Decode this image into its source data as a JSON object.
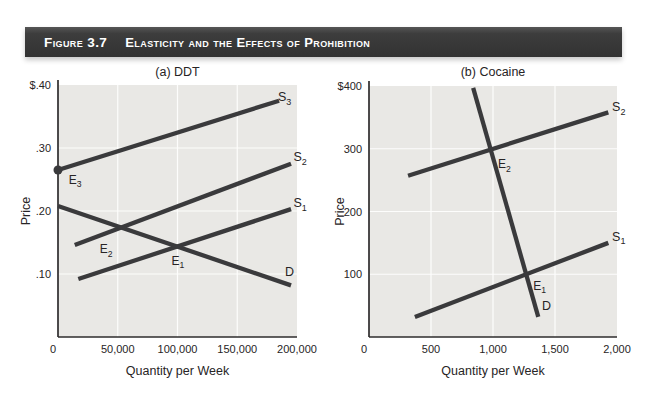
{
  "header": {
    "figure_label": "Figure 3.7",
    "figure_title": "Elasticity and the Effects of Prohibition"
  },
  "colors": {
    "header_bar": "#3d3d3d",
    "header_text": "#ffffff",
    "plot_bg": "#e9e8e5",
    "grid": "#fdfdfc",
    "axis": "#2e2c2d",
    "curve": "#3a3a3c",
    "text": "#272425"
  },
  "chart_data": [
    {
      "type": "line",
      "title": "(a) DDT",
      "xlabel": "Quantity per Week",
      "ylabel": "Price",
      "xlim": [
        0,
        200000
      ],
      "ylim": [
        0,
        0.4
      ],
      "grid": true,
      "xticks": [
        {
          "v": 0,
          "label": "0"
        },
        {
          "v": 50000,
          "label": "50,000"
        },
        {
          "v": 100000,
          "label": "100,000"
        },
        {
          "v": 150000,
          "label": "150,000"
        },
        {
          "v": 200000,
          "label": "200,000"
        }
      ],
      "yticks": [
        {
          "v": 0.4,
          "label": "$.40"
        },
        {
          "v": 0.3,
          "label": ".30"
        },
        {
          "v": 0.2,
          "label": ".20"
        },
        {
          "v": 0.1,
          "label": ".10"
        }
      ],
      "series": [
        {
          "name": "S3",
          "role": "supply",
          "label": "S",
          "sub": "3",
          "points": [
            [
              0,
              0.265
            ],
            [
              185000,
              0.375
            ]
          ],
          "label_at": [
            184000,
            0.374
          ]
        },
        {
          "name": "S2",
          "role": "supply",
          "label": "S",
          "sub": "2",
          "points": [
            [
              14000,
              0.146
            ],
            [
              195000,
              0.275
            ]
          ],
          "label_at": [
            197000,
            0.279
          ]
        },
        {
          "name": "S1",
          "role": "supply",
          "label": "S",
          "sub": "1",
          "points": [
            [
              17000,
              0.092
            ],
            [
              195000,
              0.203
            ]
          ],
          "label_at": [
            197000,
            0.206
          ]
        },
        {
          "name": "D",
          "role": "demand",
          "label": "D",
          "sub": "",
          "points": [
            [
              0,
              0.208
            ],
            [
              195000,
              0.082
            ]
          ],
          "label_at": [
            190000,
            0.097
          ]
        }
      ],
      "equilibria": [
        {
          "name": "E3",
          "label": "E",
          "sub": "3",
          "x": 0,
          "y": 0.265,
          "dot": true,
          "label_at": [
            9000,
            0.243
          ]
        },
        {
          "name": "E2",
          "label": "E",
          "sub": "2",
          "x": 52000,
          "y": 0.175,
          "dot": false,
          "label_at": [
            35000,
            0.133
          ]
        },
        {
          "name": "E1",
          "label": "E",
          "sub": "1",
          "x": 100000,
          "y": 0.144,
          "dot": false,
          "label_at": [
            95000,
            0.115
          ]
        }
      ]
    },
    {
      "type": "line",
      "title": "(b) Cocaine",
      "xlabel": "Quantity per Week",
      "ylabel": "Price",
      "xlim": [
        0,
        2000
      ],
      "ylim": [
        0,
        400
      ],
      "grid": true,
      "xticks": [
        {
          "v": 0,
          "label": "0"
        },
        {
          "v": 500,
          "label": "500"
        },
        {
          "v": 1000,
          "label": "1,000"
        },
        {
          "v": 1500,
          "label": "1,500"
        },
        {
          "v": 2000,
          "label": "2,000"
        }
      ],
      "yticks": [
        {
          "v": 400,
          "label": "$400"
        },
        {
          "v": 300,
          "label": "300"
        },
        {
          "v": 200,
          "label": "200"
        },
        {
          "v": 100,
          "label": "100"
        }
      ],
      "series": [
        {
          "name": "S2",
          "role": "supply",
          "label": "S",
          "sub": "2",
          "points": [
            [
              315,
              257
            ],
            [
              1930,
              358
            ]
          ],
          "label_at": [
            1960,
            360
          ]
        },
        {
          "name": "S1",
          "role": "supply",
          "label": "S",
          "sub": "1",
          "points": [
            [
              370,
              32
            ],
            [
              1930,
              150
            ]
          ],
          "label_at": [
            1960,
            153
          ]
        },
        {
          "name": "D",
          "role": "demand",
          "label": "D",
          "sub": "",
          "points": [
            [
              840,
              397
            ],
            [
              1365,
              32
            ]
          ],
          "label_at": [
            1395,
            43
          ]
        }
      ],
      "equilibria": [
        {
          "name": "E2",
          "label": "E",
          "sub": "2",
          "x": 1000,
          "y": 300,
          "dot": false,
          "label_at": [
            1040,
            269
          ]
        },
        {
          "name": "E1",
          "label": "E",
          "sub": "1",
          "x": 1300,
          "y": 100,
          "dot": false,
          "label_at": [
            1325,
            75
          ]
        }
      ]
    }
  ]
}
